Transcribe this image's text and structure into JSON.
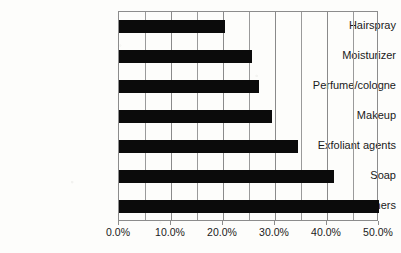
{
  "chart_data": {
    "type": "bar",
    "orientation": "horizontal",
    "title": "",
    "subtitle": "",
    "xlabel": "",
    "ylabel": "",
    "categories": [
      "Hairspray",
      "Moisturizer",
      "Perfume/cologne",
      "Makeup",
      "Exfoliant agents",
      "Soap",
      "Astringents/toners"
    ],
    "values": [
      20.4,
      25.5,
      27.0,
      29.4,
      34.4,
      41.3,
      50.0
    ],
    "value_format": "percent",
    "xlim": [
      0,
      50
    ],
    "xticks": [
      0,
      10,
      20,
      30,
      40,
      50
    ],
    "xtick_labels": [
      "0.0%",
      "10.0%",
      "20.0%",
      "30.0%",
      "40.0%",
      "50.0%"
    ],
    "gridlines_at": [
      0,
      5,
      10,
      15,
      20,
      25,
      30,
      35,
      40,
      45,
      50
    ],
    "grid": true,
    "grid_axis": "x",
    "legend": false,
    "legend_position": "none",
    "bar_color": "#0b0b0b",
    "grid_color": "#9a9a9a",
    "axis_color": "#8c8c8c",
    "background_color": "#fdfdfb"
  }
}
